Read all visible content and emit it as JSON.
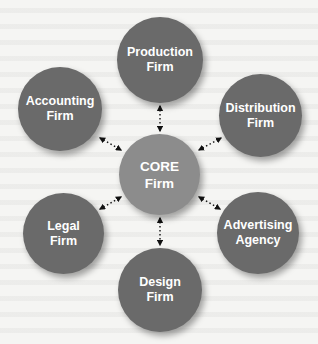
{
  "diagram": {
    "type": "hub-and-spoke",
    "colors": {
      "outer_node": "#6a6a6a",
      "core_node": "#8c8c8c",
      "text": "#ffffff",
      "connector": "#111111",
      "background": "#f5f5f3"
    },
    "core": {
      "line1": "CORE",
      "line2": "Firm"
    },
    "nodes": [
      {
        "id": "production",
        "line1": "Production",
        "line2": "Firm"
      },
      {
        "id": "distribution",
        "line1": "Distribution",
        "line2": "Firm"
      },
      {
        "id": "advertising",
        "line1": "Advertising",
        "line2": "Agency"
      },
      {
        "id": "design",
        "line1": "Design",
        "line2": "Firm"
      },
      {
        "id": "legal",
        "line1": "Legal",
        "line2": "Firm"
      },
      {
        "id": "accounting",
        "line1": "Accounting",
        "line2": "Firm"
      }
    ],
    "edges": [
      {
        "from": "core",
        "to": "production",
        "style": "dotted",
        "arrows": "both"
      },
      {
        "from": "core",
        "to": "distribution",
        "style": "dotted",
        "arrows": "both"
      },
      {
        "from": "core",
        "to": "advertising",
        "style": "dotted",
        "arrows": "both"
      },
      {
        "from": "core",
        "to": "design",
        "style": "dotted",
        "arrows": "both"
      },
      {
        "from": "core",
        "to": "legal",
        "style": "dotted",
        "arrows": "both"
      },
      {
        "from": "core",
        "to": "accounting",
        "style": "dotted",
        "arrows": "both"
      }
    ]
  }
}
